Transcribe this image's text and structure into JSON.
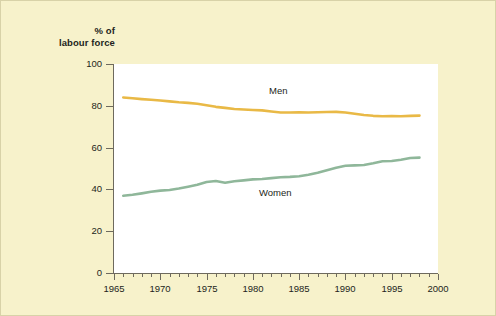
{
  "figure": {
    "background_color": "#f7f2cb",
    "plot_background_color": "#ffffff",
    "border_color": "#d8d2a8"
  },
  "axis_title": {
    "line1": "% of",
    "line2": "labour force"
  },
  "y_axis": {
    "ticks": [
      0,
      20,
      40,
      60,
      80,
      100
    ],
    "tick_labels": [
      "0",
      "20",
      "40",
      "60",
      "80",
      "100"
    ]
  },
  "x_axis": {
    "major_ticks": [
      1965,
      1970,
      1975,
      1980,
      1985,
      1990,
      1995,
      2000
    ],
    "major_tick_labels": [
      "1965",
      "1970",
      "1975",
      "1980",
      "1985",
      "1990",
      "1995",
      "2000"
    ]
  },
  "series_labels": {
    "men": "Men",
    "women": "Women"
  },
  "chart_data": {
    "type": "line",
    "title": "",
    "subtitle": "",
    "xlabel": "",
    "ylabel": "% of labour force",
    "xlim": [
      1965,
      2000
    ],
    "ylim": [
      0,
      100
    ],
    "grid": false,
    "legend": "inline-annotation",
    "colors": {
      "men": "#e9b946",
      "women": "#8fb79a"
    },
    "x": [
      1966,
      1967,
      1968,
      1969,
      1970,
      1971,
      1972,
      1973,
      1974,
      1975,
      1976,
      1977,
      1978,
      1979,
      1980,
      1981,
      1982,
      1983,
      1984,
      1985,
      1986,
      1987,
      1988,
      1989,
      1990,
      1991,
      1992,
      1993,
      1994,
      1995,
      1996,
      1997,
      1998
    ],
    "series": [
      {
        "name": "Men",
        "color": "#e9b946",
        "values": [
          84.0,
          83.6,
          83.2,
          82.9,
          82.5,
          82.1,
          81.7,
          81.4,
          81.0,
          80.3,
          79.5,
          79.0,
          78.5,
          78.2,
          78.0,
          77.8,
          77.3,
          76.8,
          76.8,
          76.9,
          76.8,
          76.9,
          77.0,
          77.1,
          76.8,
          76.2,
          75.6,
          75.2,
          75.0,
          75.1,
          75.0,
          75.2,
          75.3
        ]
      },
      {
        "name": "Women",
        "color": "#8fb79a",
        "values": [
          37.0,
          37.4,
          38.1,
          38.9,
          39.4,
          39.7,
          40.4,
          41.3,
          42.2,
          43.5,
          44.0,
          43.2,
          43.9,
          44.3,
          44.8,
          45.0,
          45.4,
          45.8,
          46.0,
          46.3,
          47.0,
          48.0,
          49.2,
          50.4,
          51.3,
          51.5,
          51.7,
          52.5,
          53.5,
          53.6,
          54.2,
          55.0,
          55.2
        ]
      }
    ]
  }
}
